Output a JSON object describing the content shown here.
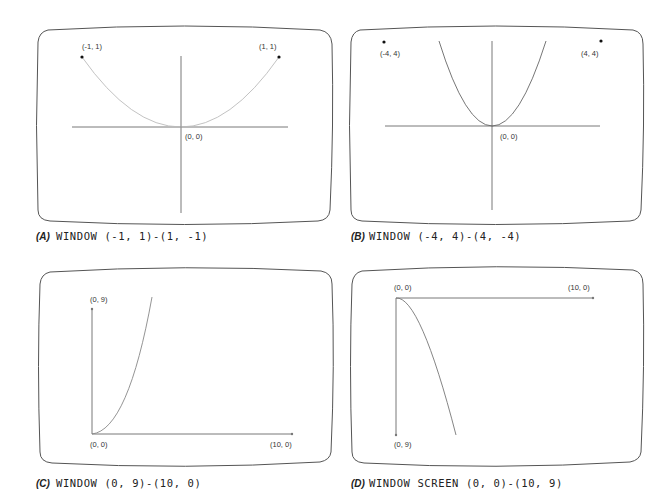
{
  "panels": [
    {
      "id": "A",
      "tag": "(A)",
      "caption": "WINDOW (-1, 1)-(1, -1)",
      "labels": {
        "left_point": "(-1,  1)",
        "right_point": "(1,  1)",
        "origin": "(0,  0)"
      }
    },
    {
      "id": "B",
      "tag": "(B)",
      "caption": "WINDOW (-4, 4)-(4, -4)",
      "labels": {
        "left_point": "(-4,  4)",
        "right_point": "(4,  4)",
        "origin": "(0,  0)"
      }
    },
    {
      "id": "C",
      "tag": "(C)",
      "caption": "WINDOW (0, 9)-(10, 0)",
      "labels": {
        "top_point": "(0,  9)",
        "origin": "(0,  0)",
        "right_point": "(10,  0)"
      }
    },
    {
      "id": "D",
      "tag": "(D)",
      "caption": "WINDOW SCREEN (0, 0)-(10, 9)",
      "labels": {
        "origin": "(0,  0)",
        "right_point": "(10,  0)",
        "bottom_point": "(0,  9)"
      }
    }
  ],
  "colors": {
    "screen_border": "#555555",
    "axis": "#555555",
    "curve_light": "#bbbbbb",
    "curve_dark": "#666666",
    "point": "#111111",
    "text": "#222222"
  }
}
